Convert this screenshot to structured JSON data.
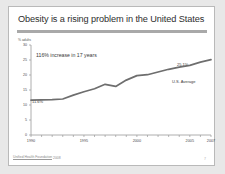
{
  "slide": {
    "title": "Obesity is a rising problem in the United States",
    "footer_source": "Unified Health Foundation",
    "footer_year": "2008",
    "page_number": "7"
  },
  "annotations": {
    "increase": "116% increase in 17 years",
    "start_value_label": "11.6%",
    "end_value_label": "25.1%",
    "series_label": "U.S. Average"
  },
  "colors": {
    "line": "#6e6e6e",
    "axis": "#9a9a9a",
    "rule": "#a9a9a9",
    "text": "#3a3a3a",
    "slide_bg": "#ffffff",
    "page_bg": "#e8e8e8"
  },
  "chart_data": {
    "type": "line",
    "title": "Obesity is a rising problem in the United States",
    "xlabel": "",
    "ylabel": "% adults",
    "ylim": [
      0,
      30
    ],
    "xlim": [
      1990,
      2007
    ],
    "grid": false,
    "legend": "none",
    "ytick_labels": [
      "0",
      "5",
      "10",
      "15",
      "20",
      "25",
      "30"
    ],
    "ytick_values": [
      0,
      5,
      10,
      15,
      20,
      25,
      30
    ],
    "xtick_labels": [
      "1990",
      "1995",
      "2000",
      "2005",
      "2007"
    ],
    "xtick_values": [
      1990,
      1995,
      2000,
      2005,
      2007
    ],
    "series": [
      {
        "name": "U.S. Average",
        "x": [
          1990,
          1991,
          1992,
          1993,
          1994,
          1995,
          1996,
          1997,
          1998,
          1999,
          2000,
          2001,
          2002,
          2003,
          2004,
          2005,
          2006,
          2007
        ],
        "values": [
          11.6,
          11.7,
          11.8,
          12.0,
          13.3,
          14.4,
          15.4,
          16.9,
          16.2,
          18.3,
          19.8,
          20.1,
          21.0,
          21.9,
          22.6,
          23.2,
          24.3,
          25.1
        ]
      }
    ],
    "annotations": [
      "116% increase in 17 years",
      "11.6%",
      "25.1%",
      "U.S. Average"
    ]
  }
}
